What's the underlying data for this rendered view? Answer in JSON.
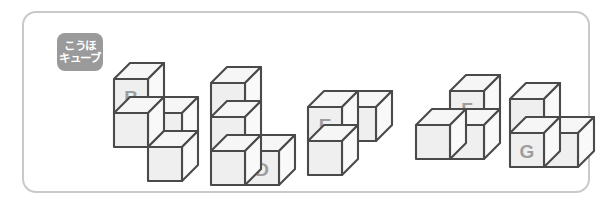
{
  "panel": {
    "badge": {
      "line1": "こうほ",
      "line2": "キューブ",
      "background_color": "#9a9a9a",
      "text_color": "#ffffff"
    },
    "border_color": "#c9c9c9",
    "background_color": "#ffffff"
  },
  "figures": [
    {
      "id": "figure-b",
      "label": "B",
      "cube_count": 4,
      "description": "One cube on top-left, a two-cube row below it, and one cube below the right column",
      "cells": [
        {
          "col": 0,
          "row": 0
        },
        {
          "col": 0,
          "row": 1
        },
        {
          "col": 1,
          "row": 1
        },
        {
          "col": 1,
          "row": 2
        }
      ],
      "label_cell": {
        "col": 0,
        "row": 0
      },
      "x": 84,
      "y": 44
    },
    {
      "id": "figure-d",
      "label": "D",
      "cube_count": 4,
      "description": "L shape: three cubes stacked vertically with one cube to the right of the bottom cube",
      "cells": [
        {
          "col": 0,
          "row": 0
        },
        {
          "col": 0,
          "row": 1
        },
        {
          "col": 0,
          "row": 2
        },
        {
          "col": 1,
          "row": 2
        }
      ],
      "label_cell": {
        "col": 1,
        "row": 2
      },
      "x": 181,
      "y": 48
    },
    {
      "id": "figure-e",
      "label": "E",
      "cube_count": 3,
      "description": "Two cubes stacked vertically with one cube to the right of the upper cube",
      "cells": [
        {
          "col": 0,
          "row": 0
        },
        {
          "col": 0,
          "row": 1
        },
        {
          "col": 1,
          "row": 0
        }
      ],
      "label_cell": {
        "col": 0,
        "row": 0
      },
      "x": 278,
      "y": 72
    },
    {
      "id": "figure-f",
      "label": "F",
      "cube_count": 3,
      "description": "Two cubes stacked vertically on the right with one cube to the left of the lower cube",
      "cells": [
        {
          "col": 1,
          "row": 0
        },
        {
          "col": 1,
          "row": 1
        },
        {
          "col": 0,
          "row": 1
        }
      ],
      "label_cell": {
        "col": 1,
        "row": 0
      },
      "x": 386,
      "y": 56
    },
    {
      "id": "figure-g",
      "label": "G",
      "cube_count": 3,
      "description": "One cube on top of the left cube, with a second cube to the right at the bottom level",
      "cells": [
        {
          "col": 0,
          "row": 0
        },
        {
          "col": 0,
          "row": 1
        },
        {
          "col": 1,
          "row": 1
        }
      ],
      "label_cell": {
        "col": 0,
        "row": 1
      },
      "x": 480,
      "y": 64
    }
  ],
  "style": {
    "face_top_color": "#f6f6f6",
    "face_left_color": "#efefef",
    "face_right_color": "#f9f9f9",
    "edge_color": "#4a4a4a",
    "label_color": "#9d9d9d"
  }
}
